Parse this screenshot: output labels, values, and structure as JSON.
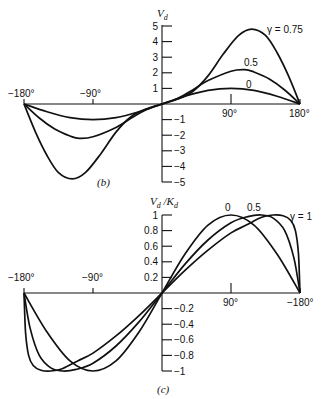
{
  "chart_data": [
    {
      "type": "line",
      "panel_label": "(b)",
      "title": "",
      "ylabel": "V_d",
      "xlabel": "",
      "x_tick_labels": [
        "−180°",
        "−90°",
        "90°",
        "180°"
      ],
      "x_ticks": [
        -180,
        -90,
        90,
        180
      ],
      "y_ticks": [
        5,
        4,
        3,
        2,
        1,
        -1,
        -2,
        -3,
        -4,
        -5
      ],
      "y_tick_labels": [
        "5",
        "4",
        "3",
        "2",
        "1",
        "−1",
        "−2",
        "−3",
        "−4",
        "−5"
      ],
      "xlim": [
        -180,
        180
      ],
      "ylim": [
        -5,
        5
      ],
      "grid": false,
      "series": [
        {
          "name": "γ = 0",
          "label": "0",
          "x": [
            -180,
            -150,
            -120,
            -90,
            -60,
            -30,
            0,
            30,
            60,
            90,
            120,
            150,
            180
          ],
          "values": [
            0,
            -0.5,
            -0.87,
            -1.0,
            -0.87,
            -0.5,
            0,
            0.5,
            0.87,
            1.0,
            0.87,
            0.5,
            0
          ]
        },
        {
          "name": "γ = 0.5",
          "label": "0.5",
          "x": [
            -180,
            -160,
            -140,
            -120,
            -108,
            -90,
            -60,
            -40,
            -20,
            0,
            20,
            40,
            60,
            90,
            108,
            120,
            140,
            160,
            180
          ],
          "values": [
            0,
            -0.9,
            -1.6,
            -2.05,
            -2.2,
            -2.1,
            -1.5,
            -0.9,
            -0.35,
            0,
            0.35,
            0.9,
            1.5,
            2.1,
            2.2,
            2.05,
            1.6,
            0.9,
            0
          ]
        },
        {
          "name": "γ = 0.75",
          "label": "γ = 0.75",
          "x": [
            -180,
            -165,
            -150,
            -135,
            -117,
            -100,
            -80,
            -60,
            -40,
            -20,
            0,
            20,
            40,
            60,
            80,
            100,
            117,
            135,
            150,
            165,
            180
          ],
          "values": [
            0,
            -1.8,
            -3.3,
            -4.4,
            -4.8,
            -4.4,
            -3.2,
            -1.8,
            -0.8,
            -0.3,
            0,
            0.3,
            0.8,
            1.8,
            3.2,
            4.4,
            4.8,
            4.4,
            3.3,
            1.8,
            0
          ]
        }
      ]
    },
    {
      "type": "line",
      "panel_label": "(c)",
      "title": "",
      "ylabel": "V_d /K_d",
      "xlabel": "",
      "x_tick_labels": [
        "−180°",
        "−90°",
        "90°",
        "−180°"
      ],
      "x_ticks": [
        -180,
        -90,
        90,
        180
      ],
      "y_ticks": [
        1,
        0.8,
        0.6,
        0.4,
        0.2,
        -0.2,
        -0.4,
        -0.6,
        -0.8,
        -1
      ],
      "y_tick_labels": [
        "1",
        "0.8",
        "0.6",
        "0.4",
        "0.2",
        "−0.2",
        "−0.4",
        "−0.6",
        "−0.8",
        "−1"
      ],
      "xlim": [
        -180,
        180
      ],
      "ylim": [
        -1,
        1
      ],
      "grid": false,
      "series": [
        {
          "name": "γ = 0",
          "label": "0",
          "x": [
            -180,
            -150,
            -120,
            -90,
            -60,
            -30,
            0,
            30,
            60,
            90,
            120,
            150,
            180
          ],
          "values": [
            0,
            -0.5,
            -0.87,
            -1.0,
            -0.87,
            -0.5,
            0,
            0.5,
            0.87,
            1.0,
            0.87,
            0.5,
            0
          ]
        },
        {
          "name": "γ = 0.5",
          "label": "0.5",
          "x": [
            -180,
            -172,
            -160,
            -145,
            -130,
            -112,
            -90,
            -60,
            -30,
            0,
            30,
            60,
            90,
            112,
            130,
            145,
            160,
            172,
            180
          ],
          "values": [
            0,
            -0.45,
            -0.8,
            -0.96,
            -1.0,
            -0.98,
            -0.9,
            -0.68,
            -0.37,
            0,
            0.37,
            0.68,
            0.9,
            0.98,
            1.0,
            0.96,
            0.8,
            0.45,
            0
          ]
        },
        {
          "name": "γ = 1",
          "label": "γ = 1",
          "x": [
            -180,
            -178,
            -174,
            -168,
            -158,
            -145,
            -130,
            -110,
            -90,
            -60,
            -30,
            0,
            30,
            60,
            90,
            110,
            130,
            145,
            158,
            168,
            174,
            178,
            180
          ],
          "values": [
            0,
            -0.5,
            -0.8,
            -0.93,
            -0.99,
            -1.0,
            -0.97,
            -0.87,
            -0.77,
            -0.55,
            -0.29,
            0,
            0.29,
            0.55,
            0.77,
            0.87,
            0.97,
            1.0,
            0.99,
            0.93,
            0.8,
            0.5,
            0
          ]
        }
      ]
    }
  ],
  "labels": {
    "b_ylabel_main": "V",
    "b_ylabel_sub": "d",
    "c_ylabel_main1": "V",
    "c_ylabel_sub1": "d",
    "c_ylabel_sep": " /K",
    "c_ylabel_sub2": "d",
    "b_panel": "(b)",
    "c_panel": "(c)",
    "b_series_0": "0",
    "b_series_05": "0.5",
    "b_series_075": "γ  =  0.75",
    "c_series_0": "0",
    "c_series_05": "0.5",
    "c_series_1": "γ  =  1",
    "b_xtick_m180": "−180°",
    "b_xtick_m90": "−90°",
    "b_xtick_90": "90°",
    "b_xtick_180": "180°",
    "c_xtick_m180": "−180°",
    "c_xtick_m90": "−90°",
    "c_xtick_90": "90°",
    "c_xtick_180": "−180°"
  }
}
